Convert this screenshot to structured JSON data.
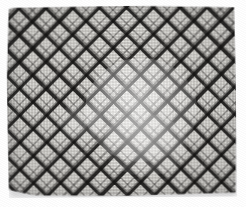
{
  "image": {
    "kind": "photograph",
    "subject": "quilt",
    "title": "Black and white crosshatch quilt",
    "alt_text": "A flat-laid black and white quilt photographed on a plain white background. Its surface is covered edge to edge with a 45-degree diagonal lattice that forms rows of light diamonds separated by dark crossing bands, producing an X or argyle plaid effect.",
    "canvas": {
      "width_px": 246,
      "height_px": 207,
      "background_color": "#ffffff"
    },
    "object_bounds": {
      "left_px": 7,
      "top_px": 6,
      "right_px": 236,
      "bottom_px": 197,
      "width_px": 229,
      "height_px": 191,
      "shape": "slightly-irregular quadrilateral, cloth laid flat with soft wavy edges"
    },
    "pattern": {
      "name": "diagonal crosshatch argyle plaid",
      "band_angle_degrees": 45,
      "repeat_px": 19,
      "band_thickness_px": 3,
      "motif": "X / cross at every band intersection, light diamond cells between",
      "has_secondary_thin_stripes": true
    },
    "colors": {
      "background": "#ffffff",
      "cloth_light": "#efeeea",
      "cloth_lightest": "#f7f6f3",
      "band_dark": "#1a1918",
      "band_mid": "#464442",
      "band_faint": "#969491",
      "shadow": "#78787c"
    },
    "lighting": {
      "glare_primary": "center-right soft highlight washing out the pattern",
      "glare_secondary": "lower-center soft highlight",
      "glare_spot": "small bright spot left of center",
      "vignette": "mild darkening toward the outer edges",
      "drop_shadow": "soft gray shadow beneath the lower and left edges"
    }
  }
}
